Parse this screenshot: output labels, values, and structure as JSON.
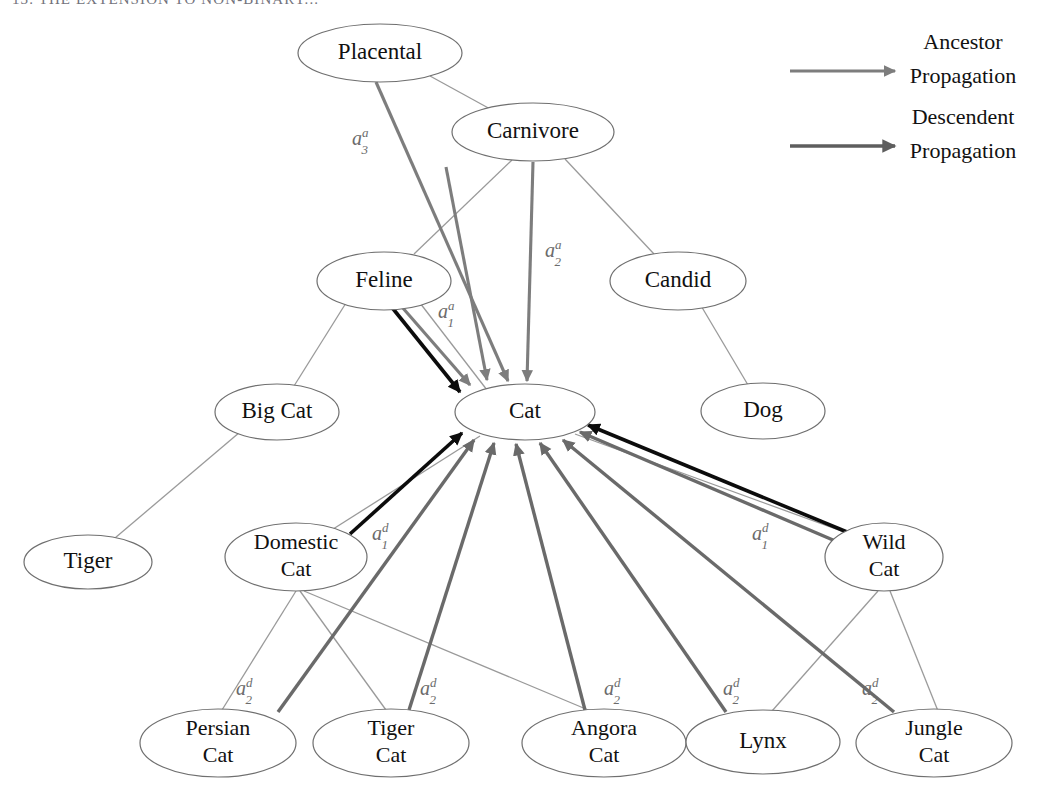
{
  "figure": {
    "header_fragment": "13. THE EXTENSION TO NON-BINARY...",
    "background_color": "#ffffff",
    "width": 1045,
    "height": 797
  },
  "legend": {
    "items": [
      {
        "id": "ancestor",
        "label_line1": "Ancestor",
        "label_line2": "Propagation",
        "color": "#7d7d7d",
        "arrow_x1": 790,
        "arrow_x2": 895,
        "arrow_y": 71,
        "text_x": 963,
        "text_y1": 49,
        "text_y2": 83
      },
      {
        "id": "descendent",
        "label_line1": "Descendent",
        "label_line2": "Propagation",
        "color": "#5e5e5e",
        "arrow_x1": 790,
        "arrow_x2": 895,
        "arrow_y": 146,
        "text_x": 963,
        "text_y1": 124,
        "text_y2": 158
      }
    ]
  },
  "nodes": [
    {
      "id": "placental",
      "label": "Placental",
      "lines": [
        "Placental"
      ],
      "cx": 380,
      "cy": 53,
      "rx": 82,
      "ry": 29
    },
    {
      "id": "carnivore",
      "label": "Carnivore",
      "lines": [
        "Carnivore"
      ],
      "cx": 533,
      "cy": 132,
      "rx": 81,
      "ry": 29
    },
    {
      "id": "feline",
      "label": "Feline",
      "lines": [
        "Feline"
      ],
      "cx": 384,
      "cy": 281,
      "rx": 67,
      "ry": 29
    },
    {
      "id": "candid",
      "label": "Candid",
      "lines": [
        "Candid"
      ],
      "cx": 678,
      "cy": 281,
      "rx": 68,
      "ry": 29
    },
    {
      "id": "big-cat",
      "label": "Big Cat",
      "lines": [
        "Big Cat"
      ],
      "cx": 277,
      "cy": 412,
      "rx": 62,
      "ry": 28
    },
    {
      "id": "cat",
      "label": "Cat",
      "lines": [
        "Cat"
      ],
      "cx": 525,
      "cy": 412,
      "rx": 70,
      "ry": 28
    },
    {
      "id": "dog",
      "label": "Dog",
      "lines": [
        "Dog"
      ],
      "cx": 763,
      "cy": 411,
      "rx": 62,
      "ry": 28
    },
    {
      "id": "tiger",
      "label": "Tiger",
      "lines": [
        "Tiger"
      ],
      "cx": 88,
      "cy": 562,
      "rx": 64,
      "ry": 27
    },
    {
      "id": "domestic-cat",
      "label": "Domestic Cat",
      "lines": [
        "Domestic",
        "Cat"
      ],
      "cx": 296,
      "cy": 557,
      "rx": 71,
      "ry": 34
    },
    {
      "id": "wild-cat",
      "label": "Wild Cat",
      "lines": [
        "Wild",
        "Cat"
      ],
      "cx": 884,
      "cy": 557,
      "rx": 59,
      "ry": 34
    },
    {
      "id": "persian-cat",
      "label": "Persian Cat",
      "lines": [
        "Persian",
        "Cat"
      ],
      "cx": 218,
      "cy": 743,
      "rx": 78,
      "ry": 34
    },
    {
      "id": "tiger-cat",
      "label": "Tiger Cat",
      "lines": [
        "Tiger",
        "Cat"
      ],
      "cx": 391,
      "cy": 743,
      "rx": 78,
      "ry": 34
    },
    {
      "id": "angora-cat",
      "label": "Angora Cat",
      "lines": [
        "Angora",
        "Cat"
      ],
      "cx": 604,
      "cy": 743,
      "rx": 82,
      "ry": 34
    },
    {
      "id": "lynx",
      "label": "Lynx",
      "lines": [
        "Lynx"
      ],
      "cx": 763,
      "cy": 742,
      "rx": 77,
      "ry": 32
    },
    {
      "id": "jungle-cat",
      "label": "Jungle Cat",
      "lines": [
        "Jungle",
        "Cat"
      ],
      "cx": 934,
      "cy": 743,
      "rx": 78,
      "ry": 34
    }
  ],
  "tree_edges": [
    {
      "id": "placental-carnivore",
      "from": "placental",
      "to": "carnivore",
      "x1": 430,
      "y1": 76,
      "x2": 492,
      "y2": 110
    },
    {
      "id": "carnivore-feline",
      "from": "carnivore",
      "to": "feline",
      "x1": 512,
      "y1": 160,
      "x2": 414,
      "y2": 254
    },
    {
      "id": "carnivore-candid",
      "from": "carnivore",
      "to": "candid",
      "x1": 565,
      "y1": 159,
      "x2": 654,
      "y2": 254
    },
    {
      "id": "feline-bigcat",
      "from": "feline",
      "to": "big-cat",
      "x1": 346,
      "y1": 303,
      "x2": 294,
      "y2": 386
    },
    {
      "id": "feline-cat",
      "from": "feline",
      "to": "cat",
      "x1": 420,
      "y1": 303,
      "x2": 487,
      "y2": 390
    },
    {
      "id": "candid-dog",
      "from": "candid",
      "to": "dog",
      "x1": 700,
      "y1": 304,
      "x2": 748,
      "y2": 385
    },
    {
      "id": "bigcat-tiger",
      "from": "big-cat",
      "to": "tiger",
      "x1": 240,
      "y1": 432,
      "x2": 115,
      "y2": 538
    },
    {
      "id": "cat-domestic",
      "from": "cat",
      "to": "domestic-cat",
      "x1": 480,
      "y1": 436,
      "x2": 330,
      "y2": 531
    },
    {
      "id": "cat-wild",
      "from": "cat",
      "to": "wild-cat",
      "x1": 575,
      "y1": 434,
      "x2": 855,
      "y2": 536
    },
    {
      "id": "domestic-persian",
      "from": "domestic-cat",
      "to": "persian-cat",
      "x1": 296,
      "y1": 591,
      "x2": 222,
      "y2": 710
    },
    {
      "id": "domestic-tigercat",
      "from": "domestic-cat",
      "to": "tiger-cat",
      "x1": 300,
      "y1": 591,
      "x2": 386,
      "y2": 710
    },
    {
      "id": "domestic-angora",
      "from": "domestic-cat",
      "to": "angora-cat",
      "x1": 304,
      "y1": 591,
      "x2": 593,
      "y2": 712
    },
    {
      "id": "wild-lynx",
      "from": "wild-cat",
      "to": "lynx",
      "x1": 878,
      "y1": 591,
      "x2": 772,
      "y2": 711
    },
    {
      "id": "wild-jungle",
      "from": "wild-cat",
      "to": "jungle-cat",
      "x1": 890,
      "y1": 591,
      "x2": 938,
      "y2": 711
    }
  ],
  "ancestor_arrows": [
    {
      "id": "anc-placental-cat",
      "from": "placental",
      "to": "cat",
      "x1": 376,
      "y1": 82,
      "x2": 508,
      "y2": 381,
      "style": "anc"
    },
    {
      "id": "anc-carnivore-cat",
      "from": "carnivore",
      "to": "cat",
      "x1": 446,
      "y1": 167,
      "x2": 487,
      "y2": 380,
      "style": "anc"
    },
    {
      "id": "anc-carnivore-cat-2",
      "from": "carnivore",
      "to": "cat",
      "x1": 533,
      "y1": 162,
      "x2": 527,
      "y2": 381,
      "style": "anc"
    },
    {
      "id": "anc-feline-cat",
      "from": "feline",
      "to": "cat",
      "x1": 402,
      "y1": 307,
      "x2": 470,
      "y2": 385,
      "style": "anc"
    },
    {
      "id": "anc-feline-cat-black",
      "from": "feline",
      "to": "cat",
      "x1": 390,
      "y1": 305,
      "x2": 460,
      "y2": 392,
      "style": "black"
    }
  ],
  "descendent_arrows": [
    {
      "id": "desc-domestic-cat-black",
      "from": "domestic-cat",
      "to": "cat",
      "x1": 350,
      "y1": 534,
      "x2": 462,
      "y2": 433,
      "style": "black"
    },
    {
      "id": "desc-persian-cat",
      "from": "persian-cat",
      "to": "cat",
      "x1": 278,
      "y1": 712,
      "x2": 474,
      "y2": 440,
      "style": "desc"
    },
    {
      "id": "desc-tigercat-cat",
      "from": "tiger-cat",
      "to": "cat",
      "x1": 409,
      "y1": 710,
      "x2": 494,
      "y2": 443,
      "style": "desc"
    },
    {
      "id": "desc-angora-cat",
      "from": "angora-cat",
      "to": "cat",
      "x1": 585,
      "y1": 710,
      "x2": 516,
      "y2": 444,
      "style": "desc"
    },
    {
      "id": "desc-lynx-cat",
      "from": "lynx",
      "to": "cat",
      "x1": 726,
      "y1": 712,
      "x2": 540,
      "y2": 443,
      "style": "desc"
    },
    {
      "id": "desc-jungle-cat",
      "from": "jungle-cat",
      "to": "cat",
      "x1": 894,
      "y1": 712,
      "x2": 563,
      "y2": 440,
      "style": "desc"
    },
    {
      "id": "desc-wildcat-gray",
      "from": "wild-cat",
      "to": "cat",
      "x1": 840,
      "y1": 543,
      "x2": 580,
      "y2": 432,
      "style": "desc"
    },
    {
      "id": "desc-wildcat-black",
      "from": "wild-cat",
      "to": "cat",
      "x1": 847,
      "y1": 532,
      "x2": 588,
      "y2": 425,
      "style": "black"
    }
  ],
  "edge_labels": [
    {
      "id": "label-a3a",
      "base": "a",
      "sup": "a",
      "sub": "3",
      "x": 352,
      "y": 145
    },
    {
      "id": "label-a2a",
      "base": "a",
      "sup": "a",
      "sub": "2",
      "x": 545,
      "y": 257
    },
    {
      "id": "label-a1a",
      "base": "a",
      "sup": "a",
      "sub": "1",
      "x": 438,
      "y": 318
    },
    {
      "id": "label-a1d-left",
      "base": "a",
      "sup": "d",
      "sub": "1",
      "x": 372,
      "y": 540
    },
    {
      "id": "label-a1d-right",
      "base": "a",
      "sup": "d",
      "sub": "1",
      "x": 752,
      "y": 540
    },
    {
      "id": "label-a2d-persian",
      "base": "a",
      "sup": "d",
      "sub": "2",
      "x": 236,
      "y": 695
    },
    {
      "id": "label-a2d-tigercat",
      "base": "a",
      "sup": "d",
      "sub": "2",
      "x": 420,
      "y": 695
    },
    {
      "id": "label-a2d-angora",
      "base": "a",
      "sup": "d",
      "sub": "2",
      "x": 604,
      "y": 695
    },
    {
      "id": "label-a2d-lynx",
      "base": "a",
      "sup": "d",
      "sub": "2",
      "x": 723,
      "y": 695
    },
    {
      "id": "label-a2d-jungle",
      "base": "a",
      "sup": "d",
      "sub": "2",
      "x": 862,
      "y": 695
    }
  ],
  "colors": {
    "node_stroke": "#6f6f6f",
    "tree_edge": "#9a9a9a",
    "ancestor_arrow": "#7d7d7d",
    "descendent_arrow": "#6a6a6a",
    "black_arrow": "#0c0c0c",
    "label_text": "#6b6b6b",
    "node_text": "#111111"
  }
}
